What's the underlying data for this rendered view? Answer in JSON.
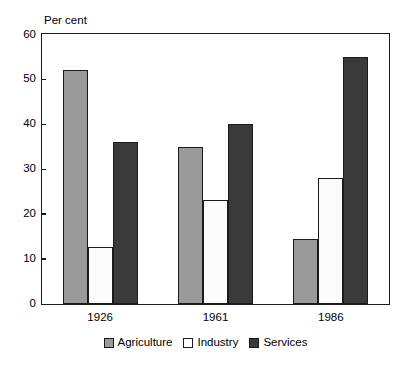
{
  "chart_data": {
    "type": "bar",
    "title": "",
    "xlabel": "",
    "ylabel": "Per cent",
    "categories": [
      "1926",
      "1961",
      "1986"
    ],
    "series": [
      {
        "name": "Agriculture",
        "color": "#9a9a9a",
        "values": [
          52,
          35,
          14.5
        ]
      },
      {
        "name": "Industry",
        "color": "#ffffff",
        "values": [
          12.5,
          23,
          28
        ]
      },
      {
        "name": "Services",
        "color": "#3a3a3a",
        "values": [
          36,
          40,
          55
        ]
      }
    ],
    "ylim": [
      0,
      60
    ],
    "ytick_values": [
      0,
      10,
      20,
      30,
      40,
      50,
      60
    ],
    "ytick_labels": [
      "0",
      "10",
      "20",
      "30",
      "40",
      "50",
      "60"
    ],
    "grid": false,
    "legend_position": "bottom",
    "frame": true,
    "bar_border_color": "#1a1a1a",
    "axis_color": "#1a1a1a"
  }
}
